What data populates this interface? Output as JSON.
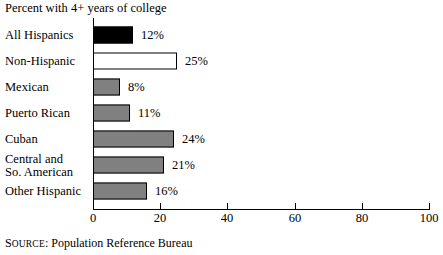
{
  "chart_data": {
    "type": "bar",
    "orientation": "horizontal",
    "title": "Percent with 4+ years of college",
    "xlabel": "",
    "ylabel": "",
    "xlim": [
      0,
      100
    ],
    "xticks": [
      0,
      20,
      40,
      60,
      80,
      100
    ],
    "grid": false,
    "legend": null,
    "categories": [
      "All Hispanics",
      "Non-Hispanic",
      "Mexican",
      "Puerto Rican",
      "Cuban",
      "Central and So. American",
      "Other Hispanic"
    ],
    "values": [
      12,
      25,
      8,
      11,
      24,
      21,
      16
    ],
    "data_labels": [
      "12%",
      "25%",
      "8%",
      "11%",
      "24%",
      "21%",
      "16%"
    ],
    "bar_styles": [
      "black",
      "white",
      "gray",
      "gray",
      "gray",
      "gray",
      "gray"
    ],
    "colors": {
      "black_fill": "#000000",
      "white_fill": "#ffffff",
      "gray_fill": "#808080",
      "bar_border": "#000000",
      "axis": "#000000",
      "text": "#000000",
      "background": "#ffffff"
    }
  },
  "rows": [
    {
      "label": "All Hispanics",
      "label_line1": "All Hispanics",
      "label_line2": "",
      "value": 12,
      "data_label": "12%",
      "style": "black"
    },
    {
      "label": "Non-Hispanic",
      "label_line1": "Non-Hispanic",
      "label_line2": "",
      "value": 25,
      "data_label": "25%",
      "style": "white"
    },
    {
      "label": "Mexican",
      "label_line1": "Mexican",
      "label_line2": "",
      "value": 8,
      "data_label": "8%",
      "style": "gray"
    },
    {
      "label": "Puerto Rican",
      "label_line1": "Puerto Rican",
      "label_line2": "",
      "value": 11,
      "data_label": "11%",
      "style": "gray"
    },
    {
      "label": "Cuban",
      "label_line1": "Cuban",
      "label_line2": "",
      "value": 24,
      "data_label": "24%",
      "style": "gray"
    },
    {
      "label": "Central and So. American",
      "label_line1": "Central and",
      "label_line2": "So. American",
      "value": 21,
      "data_label": "21%",
      "style": "gray"
    },
    {
      "label": "Other Hispanic",
      "label_line1": "Other Hispanic",
      "label_line2": "",
      "value": 16,
      "data_label": "16%",
      "style": "gray"
    }
  ],
  "axis": {
    "ticks": [
      {
        "value": 0,
        "label": "0"
      },
      {
        "value": 20,
        "label": "20"
      },
      {
        "value": 40,
        "label": "40"
      },
      {
        "value": 60,
        "label": "60"
      },
      {
        "value": 80,
        "label": "80"
      },
      {
        "value": 100,
        "label": "100"
      }
    ]
  },
  "source": {
    "prefix_first": "S",
    "prefix_rest": "OURCE",
    "separator": ":",
    "text": "Population Reference Bureau",
    "full": "SOURCE: Population Reference Bureau"
  }
}
